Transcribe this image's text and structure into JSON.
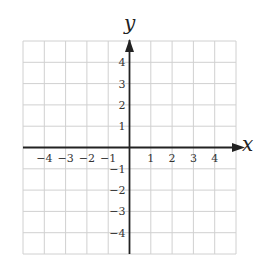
{
  "diagram": {
    "type": "coordinate-grid",
    "axis_labels": {
      "x": "x",
      "y": "y"
    },
    "x_range": [
      -5,
      5
    ],
    "y_range": [
      -5,
      5
    ],
    "x_tick_labels": [
      "-4",
      "-3",
      "-2",
      "-1",
      "1",
      "2",
      "3",
      "4"
    ],
    "y_tick_labels": [
      "4",
      "3",
      "2",
      "1",
      "-1",
      "-2",
      "-3",
      "-4"
    ],
    "colors": {
      "grid": "#d0d0d0",
      "axis": "#222222",
      "text": "#333333"
    }
  }
}
